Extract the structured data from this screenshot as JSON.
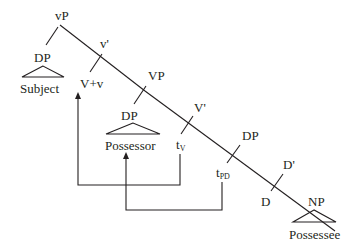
{
  "diagram": {
    "type": "syntax-tree",
    "nodes": {
      "vP": "vP",
      "DP_subject": "DP",
      "subject": "Subject",
      "v_bar": "v'",
      "V_plus_v": "V+v",
      "VP": "VP",
      "DP_possessor": "DP",
      "possessor": "Possessor",
      "V_bar": "V'",
      "t_V_base": "t",
      "t_V_sub": "V",
      "DP_possessee_phrase": "DP",
      "t_PD_base": "t",
      "t_PD_sub": "PD",
      "D_bar": "D'",
      "D": "D",
      "NP": "NP",
      "possessee": "Possessee"
    },
    "movements": [
      {
        "from": "tV",
        "to": "V+v"
      },
      {
        "from": "tPD",
        "to": "Possessor"
      }
    ]
  }
}
